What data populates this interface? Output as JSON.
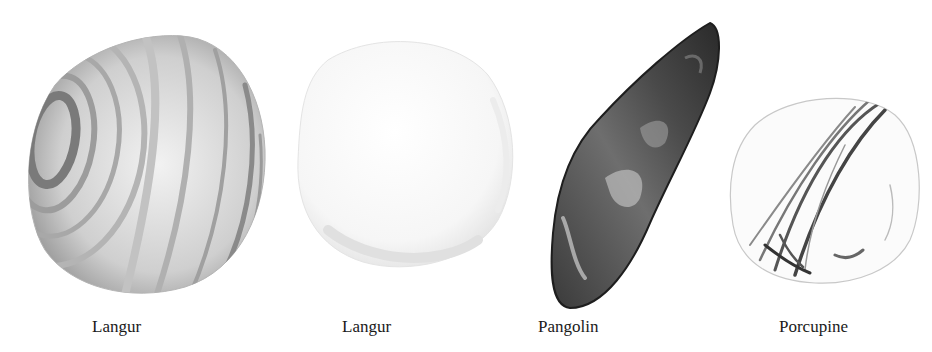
{
  "figure": {
    "caption_fragment": "",
    "items": [
      {
        "label": "Langur",
        "style": "banded-grey"
      },
      {
        "label": "Langur",
        "style": "pale-white"
      },
      {
        "label": "Pangolin",
        "style": "dark-elongated"
      },
      {
        "label": "Porcupine",
        "style": "white-streaked"
      }
    ]
  },
  "colors": {
    "background": "#ffffff",
    "label_text": "#1a1a1a",
    "stone_dark": "#2a2a2a",
    "stone_mid": "#8a8a8a",
    "stone_light": "#e6e6e6"
  }
}
